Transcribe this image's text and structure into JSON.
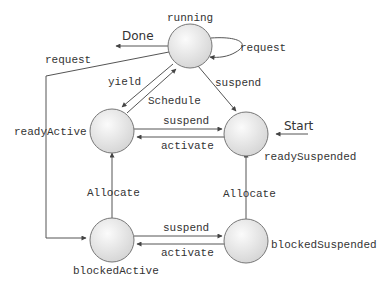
{
  "diagram": {
    "type": "state-transition",
    "states": [
      {
        "id": "running",
        "label": "running",
        "cx": 190,
        "cy": 45
      },
      {
        "id": "readyActive",
        "label": "readyActive",
        "cx": 112,
        "cy": 157
      },
      {
        "id": "readySuspended",
        "label": "readySuspended",
        "cx": 246,
        "cy": 157
      },
      {
        "id": "blockedActive",
        "label": "blockedActive",
        "cx": 112,
        "cy": 238
      },
      {
        "id": "blockedSuspended",
        "label": "blockedSuspended",
        "cx": 246,
        "cy": 238
      }
    ],
    "terminals": {
      "done": "Done",
      "start": "Start"
    },
    "transitions": {
      "running_done": "Done",
      "running_self": "request",
      "running_to_blockedActive": "request",
      "running_to_readyActive": "yield",
      "readyActive_to_running": "Schedule",
      "running_to_readySuspended": "suspend",
      "readyActive_to_readySuspended": "suspend",
      "readySuspended_to_readyActive": "activate",
      "blockedActive_to_readyActive": "Allocate",
      "blockedSuspended_to_readySuspended": "Allocate",
      "blockedActive_to_blockedSuspended": "suspend",
      "blockedSuspended_to_blockedActive": "activate",
      "start_to_readySuspended": "Start"
    },
    "colors": {
      "node_fill_light": "#fafafa",
      "node_fill_dark": "#d6d6d6",
      "node_stroke": "#777777",
      "edge": "#555555",
      "text": "#333333"
    }
  }
}
